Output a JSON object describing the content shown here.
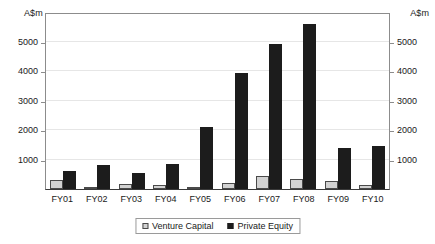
{
  "chart_data": {
    "type": "bar",
    "title": "",
    "xlabel": "",
    "ylabel": "A$m",
    "y_axis_unit_left": "A$m",
    "y_axis_unit_right": "A$m",
    "ylim": [
      0,
      6000
    ],
    "yticks": [
      1000,
      2000,
      3000,
      4000,
      5000
    ],
    "ytick_labels": [
      "1000",
      "2000",
      "3000",
      "4000",
      "5000"
    ],
    "grid": true,
    "dual_axis": true,
    "legend_position": "bottom-center",
    "categories": [
      "FY01",
      "FY02",
      "FY03",
      "FY04",
      "FY05",
      "FY06",
      "FY07",
      "FY08",
      "FY09",
      "FY10"
    ],
    "series": [
      {
        "name": "Venture Capital",
        "color": "#d2d2d2",
        "values": [
          320,
          50,
          170,
          140,
          70,
          200,
          450,
          350,
          280,
          150
        ]
      },
      {
        "name": "Private Equity",
        "color": "#1c1c1c",
        "values": [
          600,
          800,
          530,
          860,
          2090,
          3930,
          4930,
          5580,
          1400,
          1460
        ]
      }
    ]
  },
  "legend": {
    "items": [
      {
        "label": "Venture Capital",
        "swatch": "legend-swatch-venture-capital"
      },
      {
        "label": "Private Equity",
        "swatch": "legend-swatch-private-equity"
      }
    ]
  }
}
